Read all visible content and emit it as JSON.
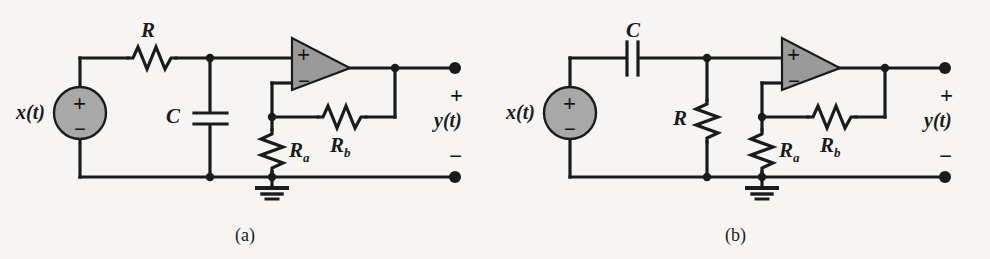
{
  "figure": {
    "type": "circuit-diagram",
    "background_color": "#f6f5f3",
    "line_color": "#1b1b1b",
    "opamp_fill_color": "#9a9a9a",
    "source_fill_color": "#a8a8a8",
    "panels": [
      {
        "id": "a",
        "caption": "(a)",
        "description": "Low-pass RC network driving a non-inverting op-amp amplifier",
        "labels": {
          "source": "x(t)",
          "series_element": "R",
          "shunt_element": "C",
          "gain_lower": "R",
          "gain_lower_sub": "a",
          "gain_feedback": "R",
          "gain_feedback_sub": "b",
          "output": "y(t)",
          "output_plus": "+",
          "output_minus": "−",
          "opamp_noninverting": "+",
          "opamp_inverting": "−",
          "source_plus": "+",
          "source_minus": "−"
        }
      },
      {
        "id": "b",
        "caption": "(b)",
        "description": "High-pass CR network driving a non-inverting op-amp amplifier",
        "labels": {
          "source": "x(t)",
          "series_element": "C",
          "shunt_element": "R",
          "gain_lower": "R",
          "gain_lower_sub": "a",
          "gain_feedback": "R",
          "gain_feedback_sub": "b",
          "output": "y(t)",
          "output_plus": "+",
          "output_minus": "−",
          "opamp_noninverting": "+",
          "opamp_inverting": "−",
          "source_plus": "+",
          "source_minus": "−"
        }
      }
    ]
  }
}
